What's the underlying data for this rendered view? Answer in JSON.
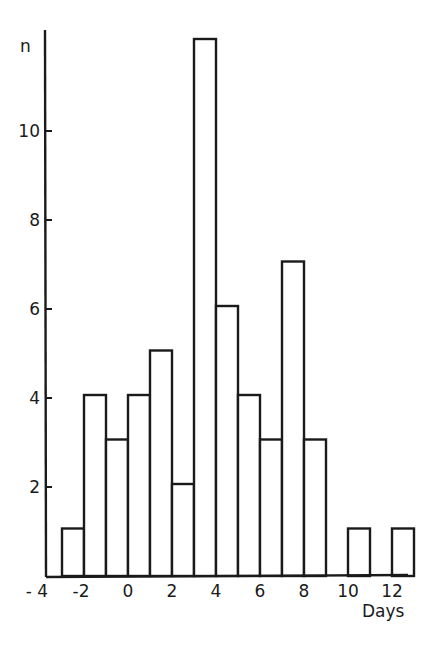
{
  "chart_data": {
    "type": "bar",
    "title": "",
    "xlabel": "Days",
    "ylabel": "n",
    "x_tick_labels": [
      "-4",
      "-2",
      "0",
      "2",
      "4",
      "6",
      "8",
      "10",
      "12"
    ],
    "y_tick_labels": [
      "2",
      "4",
      "6",
      "8",
      "10"
    ],
    "xlim": [
      -4,
      13
    ],
    "ylim": [
      0,
      12.5
    ],
    "grid": false,
    "legend": null,
    "bin_width": 1,
    "bins": [
      {
        "start": -3,
        "end": -2,
        "count": 1
      },
      {
        "start": -2,
        "end": -1,
        "count": 4
      },
      {
        "start": -1,
        "end": 0,
        "count": 3
      },
      {
        "start": 0,
        "end": 1,
        "count": 4
      },
      {
        "start": 1,
        "end": 2,
        "count": 5
      },
      {
        "start": 2,
        "end": 3,
        "count": 2
      },
      {
        "start": 3,
        "end": 4,
        "count": 12
      },
      {
        "start": 4,
        "end": 5,
        "count": 6
      },
      {
        "start": 5,
        "end": 6,
        "count": 4
      },
      {
        "start": 6,
        "end": 7,
        "count": 3
      },
      {
        "start": 7,
        "end": 8,
        "count": 7
      },
      {
        "start": 8,
        "end": 9,
        "count": 3
      },
      {
        "start": 9,
        "end": 10,
        "count": 0
      },
      {
        "start": 10,
        "end": 11,
        "count": 1
      },
      {
        "start": 11,
        "end": 12,
        "count": 0
      },
      {
        "start": 12,
        "end": 13,
        "count": 1
      }
    ],
    "categories": [
      "-3",
      "-2",
      "-1",
      "0",
      "1",
      "2",
      "3",
      "4",
      "5",
      "6",
      "7",
      "8",
      "9",
      "10",
      "11",
      "12"
    ],
    "values": [
      1,
      4,
      3,
      4,
      5,
      2,
      12,
      6,
      4,
      3,
      7,
      3,
      0,
      1,
      0,
      1
    ]
  },
  "colors": {
    "ink": "#1a1a1a",
    "background": "#ffffff"
  }
}
